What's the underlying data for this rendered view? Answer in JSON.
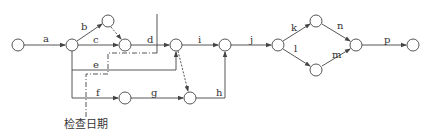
{
  "diagram": {
    "type": "network-plan",
    "colors": {
      "line": "#444444",
      "node_fill": "#ffffff",
      "background": "#ffffff"
    },
    "nodes": [
      {
        "id": "n1",
        "x": 18,
        "y": 45
      },
      {
        "id": "n2",
        "x": 72,
        "y": 45
      },
      {
        "id": "n3",
        "x": 108,
        "y": 21
      },
      {
        "id": "n4",
        "x": 125,
        "y": 45
      },
      {
        "id": "n5",
        "x": 176,
        "y": 45
      },
      {
        "id": "n6",
        "x": 125,
        "y": 98
      },
      {
        "id": "n7",
        "x": 190,
        "y": 98
      },
      {
        "id": "n8",
        "x": 225,
        "y": 45
      },
      {
        "id": "n9",
        "x": 278,
        "y": 45
      },
      {
        "id": "n10",
        "x": 316,
        "y": 21
      },
      {
        "id": "n11",
        "x": 316,
        "y": 70
      },
      {
        "id": "n12",
        "x": 356,
        "y": 45
      },
      {
        "id": "n13",
        "x": 413,
        "y": 45
      }
    ],
    "activities": [
      {
        "label": "a",
        "from": "n1",
        "to": "n2"
      },
      {
        "label": "b",
        "from": "n2",
        "to": "n3"
      },
      {
        "label": "c",
        "from": "n2",
        "to": "n4"
      },
      {
        "label": "d",
        "from": "n4",
        "to": "n5"
      },
      {
        "label": "e",
        "from": "n2",
        "to": "n5"
      },
      {
        "label": "f",
        "from": "n2",
        "to": "n6"
      },
      {
        "label": "g",
        "from": "n6",
        "to": "n7"
      },
      {
        "label": "h",
        "from": "n7",
        "to": "n8"
      },
      {
        "label": "i",
        "from": "n5",
        "to": "n8"
      },
      {
        "label": "j",
        "from": "n8",
        "to": "n9"
      },
      {
        "label": "k",
        "from": "n9",
        "to": "n10"
      },
      {
        "label": "l",
        "from": "n9",
        "to": "n11"
      },
      {
        "label": "n",
        "from": "n10",
        "to": "n12"
      },
      {
        "label": "m",
        "from": "n11",
        "to": "n12"
      },
      {
        "label": "p",
        "from": "n12",
        "to": "n13"
      }
    ],
    "dummy_activities": [
      {
        "from": "n3",
        "to": "n4"
      },
      {
        "from": "n5",
        "to": "n7"
      }
    ],
    "check_line_label": "检查日期",
    "labels": {
      "a": "a",
      "b": "b",
      "c": "c",
      "d": "d",
      "e": "e",
      "f": "f",
      "g": "g",
      "h": "h",
      "i": "i",
      "j": "j",
      "k": "k",
      "l": "l",
      "m": "m",
      "n": "n",
      "p": "p"
    }
  }
}
